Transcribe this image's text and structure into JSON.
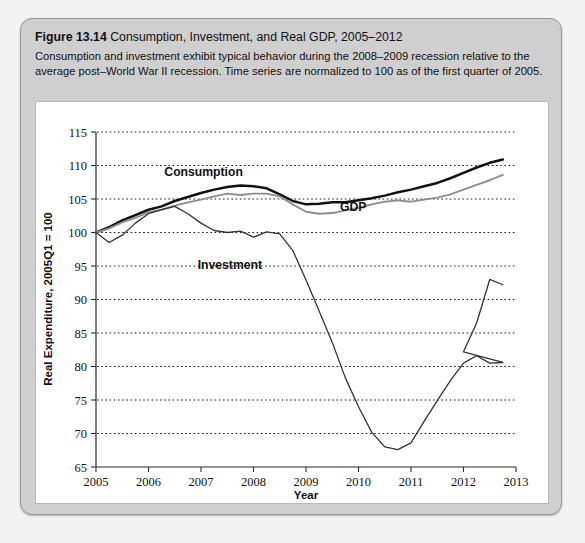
{
  "figure": {
    "label": "Figure 13.14",
    "title": "Consumption, Investment, and Real GDP, 2005–2012",
    "description": "Consumption and investment exhibit typical behavior during the 2008–2009 recession relative to the average post–World War II recession. Time series are normalized to 100 as of the first quarter of 2005."
  },
  "colors": {
    "card_background": "#cfcfcf",
    "panel_background": "#ffffff",
    "consumption_line": "#111111",
    "gdp_line": "#8d8d8d",
    "investment_line": "#333333",
    "gridline": "#1a1a1a"
  },
  "chart_data": {
    "type": "line",
    "title": "Consumption, Investment, and Real GDP, 2005–2012",
    "xlabel": "Year",
    "ylabel": "Real Expenditure, 2005Q1 = 100",
    "xlim": [
      2005,
      2013
    ],
    "ylim": [
      65,
      115
    ],
    "ytick_labels": [
      "65",
      "70",
      "75",
      "80",
      "85",
      "90",
      "95",
      "100",
      "105",
      "110",
      "115"
    ],
    "yticks": [
      65,
      70,
      75,
      80,
      85,
      90,
      95,
      100,
      105,
      110,
      115
    ],
    "xtick_labels": [
      "2005",
      "2006",
      "2007",
      "2008",
      "2009",
      "2010",
      "2011",
      "2012",
      "2013"
    ],
    "xticks": [
      2005,
      2006,
      2007,
      2008,
      2009,
      2010,
      2011,
      2012,
      2013
    ],
    "grid": "horizontal-dotted",
    "legend": "inline-annotations",
    "x": [
      2005.0,
      2005.25,
      2005.5,
      2005.75,
      2006.0,
      2006.25,
      2006.5,
      2006.75,
      2007.0,
      2007.25,
      2007.5,
      2007.75,
      2008.0,
      2008.25,
      2008.5,
      2008.75,
      2009.0,
      2009.25,
      2009.5,
      2009.75,
      2010.0,
      2010.25,
      2010.5,
      2010.75,
      2011.0,
      2011.25,
      2011.5,
      2011.75,
      2012.0,
      2012.25,
      2012.5,
      2012.75
    ],
    "series": [
      {
        "name": "Consumption",
        "label_position": {
          "x": 2007.05,
          "y": 108.4
        },
        "values": [
          100.0,
          100.8,
          101.8,
          102.6,
          103.4,
          103.9,
          104.7,
          105.3,
          105.9,
          106.4,
          106.8,
          107.0,
          106.9,
          106.6,
          105.7,
          104.7,
          104.2,
          104.3,
          104.5,
          104.5,
          104.8,
          105.1,
          105.5,
          106.0,
          106.4,
          106.9,
          107.4,
          108.1,
          108.9,
          109.7,
          110.4,
          110.9
        ]
      },
      {
        "name": "GDP",
        "label_position": {
          "x": 2009.9,
          "y": 103.2
        },
        "values": [
          100.0,
          100.6,
          101.5,
          102.2,
          103.0,
          103.4,
          104.0,
          104.5,
          104.9,
          105.4,
          105.8,
          105.6,
          105.8,
          105.8,
          105.4,
          104.2,
          103.1,
          102.8,
          102.9,
          103.3,
          103.7,
          104.2,
          104.6,
          104.8,
          104.6,
          104.9,
          105.2,
          105.7,
          106.4,
          107.1,
          107.8,
          108.6
        ]
      },
      {
        "name": "Investment",
        "label_position": {
          "x": 2007.55,
          "y": 94.6
        },
        "values": [
          100.0,
          98.5,
          99.6,
          101.4,
          102.8,
          103.4,
          103.9,
          102.8,
          101.4,
          100.3,
          100.0,
          100.2,
          99.3,
          100.1,
          99.8,
          97.3,
          92.9,
          88.3,
          83.6,
          78.3,
          74.0,
          70.2,
          68.0,
          67.6,
          68.6,
          71.8,
          74.9,
          77.9,
          80.5,
          81.6,
          80.5,
          80.6
        ]
      }
    ],
    "investment_tail": {
      "note": "Investment continues rising to about 93 by 2012 and eases to about 92 at the end of the sample.",
      "x": [
        2012.0,
        2012.25,
        2012.5,
        2012.75
      ],
      "values": [
        82.2,
        86.5,
        93.0,
        92.2
      ]
    }
  }
}
